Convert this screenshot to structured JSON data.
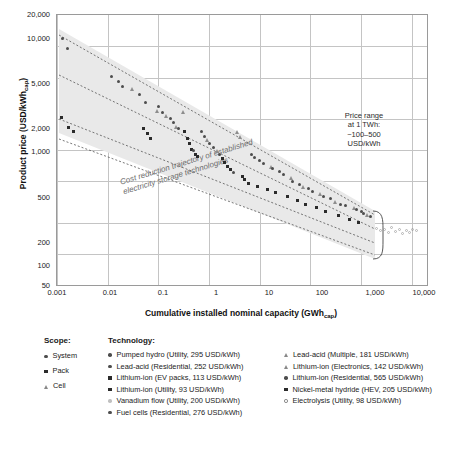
{
  "chart_data": {
    "type": "scatter",
    "title": "",
    "xlabel": "Cumulative installed nominal capacity (GWh_cap)",
    "xlabel_main": "Cumulative installed nominal capacity (GWh",
    "xlabel_sub": "cap",
    "ylabel_main": "Product price (USD/kWh",
    "ylabel_sub": "cap",
    "xscale": "log",
    "yscale": "log",
    "xlim": [
      0.001,
      20000
    ],
    "ylim": [
      50,
      20000
    ],
    "xticks": [
      "0.001",
      "0.01",
      "0.1",
      "1",
      "10",
      "100",
      "1,000",
      "10,000"
    ],
    "yticks": [
      "50",
      "100",
      "200",
      "500",
      "1,000",
      "2,000",
      "5,000",
      "10,000",
      "20,000"
    ],
    "grid": true,
    "legend_position": "below",
    "annotations": [
      {
        "id": "price-range-note",
        "text": "Price range\nat 1 TWh:\n~100–500\nUSD/kWh"
      },
      {
        "id": "trajectory-note",
        "text": "Cost reduction trajectory of established\nelectricity storage technologies"
      }
    ],
    "series": [
      {
        "name": "Pumped hydro (Utility, 295 USD/kWh)",
        "scope": "System",
        "marker": "circle",
        "color": "#4d4d4d"
      },
      {
        "name": "Lead-acid (Residential, 252 USD/kWh)",
        "scope": "System",
        "marker": "circle",
        "color": "#4d4d4d"
      },
      {
        "name": "Lithium-ion (EV packs, 113 USD/kWh)",
        "scope": "Pack",
        "marker": "square",
        "color": "#2b2b2b"
      },
      {
        "name": "Lithium-ion (Utility, 93 USD/kWh)",
        "scope": "Pack",
        "marker": "square",
        "color": "#2b2b2b"
      },
      {
        "name": "Vanadium flow (Utility, 200 USD/kWh)",
        "scope": "System",
        "marker": "circle-light",
        "color": "#b5b5b5"
      },
      {
        "name": "Fuel cells (Residential, 276 USD/kWh)",
        "scope": "System",
        "marker": "circle",
        "color": "#5a5a5a"
      },
      {
        "name": "Lead-acid (Multiple, 181 USD/kWh)",
        "scope": "Cell",
        "marker": "triangle",
        "color": "#8d8d8d"
      },
      {
        "name": "Lithium-ion (Electronics, 142 USD/kWh)",
        "scope": "Cell",
        "marker": "triangle",
        "color": "#8d8d8d"
      },
      {
        "name": "Lithium-ion (Residential, 565 USD/kWh)",
        "scope": "System",
        "marker": "circle",
        "color": "#4d4d4d"
      },
      {
        "name": "Nickel-metal hydride (HEV, 205 USD/kWh)",
        "scope": "Pack",
        "marker": "square",
        "color": "#2b2b2b"
      },
      {
        "name": "Electrolysis (Utility, 98 USD/kWh)",
        "scope": "System",
        "marker": "ring",
        "color": "#777777"
      }
    ],
    "points": [
      {
        "x": 0.0013,
        "y": 12000,
        "m": "system"
      },
      {
        "x": 0.0016,
        "y": 9500,
        "m": "system"
      },
      {
        "x": 0.0012,
        "y": 2050,
        "m": "pack"
      },
      {
        "x": 0.0017,
        "y": 1650,
        "m": "pack"
      },
      {
        "x": 0.0021,
        "y": 1500,
        "m": "pack"
      },
      {
        "x": 0.012,
        "y": 5100,
        "m": "system"
      },
      {
        "x": 0.016,
        "y": 4600,
        "m": "system"
      },
      {
        "x": 0.02,
        "y": 4100,
        "m": "system"
      },
      {
        "x": 0.03,
        "y": 3900,
        "m": "cell"
      },
      {
        "x": 0.042,
        "y": 3400,
        "m": "system"
      },
      {
        "x": 0.055,
        "y": 2900,
        "m": "system"
      },
      {
        "x": 0.05,
        "y": 1600,
        "m": "pack"
      },
      {
        "x": 0.06,
        "y": 1450,
        "m": "pack"
      },
      {
        "x": 0.07,
        "y": 1280,
        "m": "pack"
      },
      {
        "x": 0.09,
        "y": 2400,
        "m": "cell"
      },
      {
        "x": 0.1,
        "y": 2600,
        "m": "system"
      },
      {
        "x": 0.12,
        "y": 2300,
        "m": "system"
      },
      {
        "x": 0.14,
        "y": 2150,
        "m": "cell"
      },
      {
        "x": 0.17,
        "y": 2000,
        "m": "system"
      },
      {
        "x": 0.2,
        "y": 1850,
        "m": "system"
      },
      {
        "x": 0.22,
        "y": 1700,
        "m": "cell"
      },
      {
        "x": 0.25,
        "y": 1600,
        "m": "system"
      },
      {
        "x": 0.3,
        "y": 2350,
        "m": "cell"
      },
      {
        "x": 0.33,
        "y": 1500,
        "m": "pack"
      },
      {
        "x": 0.38,
        "y": 1300,
        "m": "pack"
      },
      {
        "x": 0.42,
        "y": 1150,
        "m": "pack"
      },
      {
        "x": 0.45,
        "y": 1020,
        "m": "pack"
      },
      {
        "x": 0.5,
        "y": 980,
        "m": "system"
      },
      {
        "x": 0.55,
        "y": 900,
        "m": "pack"
      },
      {
        "x": 0.6,
        "y": 870,
        "m": "pack"
      },
      {
        "x": 0.7,
        "y": 1500,
        "m": "system"
      },
      {
        "x": 0.8,
        "y": 1350,
        "m": "system"
      },
      {
        "x": 0.9,
        "y": 1250,
        "m": "cell"
      },
      {
        "x": 1.0,
        "y": 1150,
        "m": "system"
      },
      {
        "x": 1.2,
        "y": 1050,
        "m": "system"
      },
      {
        "x": 1.4,
        "y": 980,
        "m": "cell"
      },
      {
        "x": 1.6,
        "y": 900,
        "m": "system"
      },
      {
        "x": 1.8,
        "y": 820,
        "m": "pack"
      },
      {
        "x": 2.0,
        "y": 760,
        "m": "pack"
      },
      {
        "x": 2.3,
        "y": 700,
        "m": "pack"
      },
      {
        "x": 2.7,
        "y": 650,
        "m": "pack"
      },
      {
        "x": 3.0,
        "y": 610,
        "m": "system"
      },
      {
        "x": 3.5,
        "y": 1500,
        "m": "cell"
      },
      {
        "x": 4.0,
        "y": 1350,
        "m": "cell"
      },
      {
        "x": 4.5,
        "y": 560,
        "m": "pack"
      },
      {
        "x": 5.0,
        "y": 520,
        "m": "pack"
      },
      {
        "x": 6.0,
        "y": 480,
        "m": "pack"
      },
      {
        "x": 7.0,
        "y": 900,
        "m": "system"
      },
      {
        "x": 8.0,
        "y": 840,
        "m": "system"
      },
      {
        "x": 9.0,
        "y": 450,
        "m": "pack"
      },
      {
        "x": 10,
        "y": 800,
        "m": "system"
      },
      {
        "x": 12,
        "y": 740,
        "m": "system"
      },
      {
        "x": 14,
        "y": 420,
        "m": "pack"
      },
      {
        "x": 16,
        "y": 700,
        "m": "cell"
      },
      {
        "x": 18,
        "y": 660,
        "m": "system"
      },
      {
        "x": 20,
        "y": 390,
        "m": "pack"
      },
      {
        "x": 25,
        "y": 620,
        "m": "system"
      },
      {
        "x": 30,
        "y": 580,
        "m": "system"
      },
      {
        "x": 35,
        "y": 360,
        "m": "pack"
      },
      {
        "x": 40,
        "y": 540,
        "m": "cell"
      },
      {
        "x": 45,
        "y": 500,
        "m": "system"
      },
      {
        "x": 55,
        "y": 330,
        "m": "pack"
      },
      {
        "x": 60,
        "y": 470,
        "m": "system"
      },
      {
        "x": 70,
        "y": 450,
        "m": "cell"
      },
      {
        "x": 80,
        "y": 300,
        "m": "pack"
      },
      {
        "x": 90,
        "y": 430,
        "m": "system"
      },
      {
        "x": 110,
        "y": 400,
        "m": "system"
      },
      {
        "x": 130,
        "y": 280,
        "m": "pack"
      },
      {
        "x": 150,
        "y": 380,
        "m": "cell"
      },
      {
        "x": 180,
        "y": 360,
        "m": "system"
      },
      {
        "x": 200,
        "y": 255,
        "m": "pack"
      },
      {
        "x": 250,
        "y": 340,
        "m": "system"
      },
      {
        "x": 300,
        "y": 320,
        "m": "cell"
      },
      {
        "x": 350,
        "y": 235,
        "m": "pack"
      },
      {
        "x": 400,
        "y": 300,
        "m": "system"
      },
      {
        "x": 500,
        "y": 290,
        "m": "system"
      },
      {
        "x": 600,
        "y": 215,
        "m": "pack"
      },
      {
        "x": 700,
        "y": 280,
        "m": "cell"
      },
      {
        "x": 800,
        "y": 265,
        "m": "system"
      },
      {
        "x": 900,
        "y": 200,
        "m": "pack"
      },
      {
        "x": 1000,
        "y": 255,
        "m": "system"
      },
      {
        "x": 1100,
        "y": 245,
        "m": "system"
      },
      {
        "x": 1300,
        "y": 240,
        "m": "cell"
      },
      {
        "x": 1500,
        "y": 230,
        "m": "system"
      },
      {
        "x": 2000,
        "y": 175,
        "m": "ring"
      },
      {
        "x": 2400,
        "y": 168,
        "m": "ring"
      },
      {
        "x": 2900,
        "y": 172,
        "m": "ring"
      },
      {
        "x": 3400,
        "y": 160,
        "m": "ring"
      },
      {
        "x": 4000,
        "y": 178,
        "m": "ring"
      },
      {
        "x": 4800,
        "y": 165,
        "m": "ring"
      },
      {
        "x": 5600,
        "y": 170,
        "m": "ring"
      },
      {
        "x": 6600,
        "y": 158,
        "m": "ring"
      },
      {
        "x": 7800,
        "y": 168,
        "m": "ring"
      },
      {
        "x": 9000,
        "y": 162,
        "m": "ring"
      },
      {
        "x": 10500,
        "y": 172,
        "m": "ring"
      },
      {
        "x": 12500,
        "y": 166,
        "m": "ring"
      }
    ]
  },
  "legend": {
    "scope_header": "Scope:",
    "tech_header": "Technology:",
    "scope_items": [
      {
        "label": "System",
        "marker": "circle"
      },
      {
        "label": "Pack",
        "marker": "square"
      },
      {
        "label": "Cell",
        "marker": "triangle"
      }
    ],
    "tech_items": [
      {
        "label": "Pumped hydro (Utility, 295 USD/kWh)",
        "marker": "circle"
      },
      {
        "label": "Lead-acid (Multiple, 181 USD/kWh)",
        "marker": "triangle"
      },
      {
        "label": "Lead-acid (Residential, 252 USD/kWh)",
        "marker": "circle"
      },
      {
        "label": "Lithium-ion (Electronics, 142 USD/kWh)",
        "marker": "triangle"
      },
      {
        "label": "Lithium-ion (EV packs, 113 USD/kWh)",
        "marker": "square"
      },
      {
        "label": "Lithium-ion (Residential, 565 USD/kWh)",
        "marker": "circle"
      },
      {
        "label": "Lithium-ion (Utility, 93 USD/kWh)",
        "marker": "square"
      },
      {
        "label": "Nickel-metal hydride (HEV, 205 USD/kWh)",
        "marker": "square"
      },
      {
        "label": "Vanadium flow (Utility, 200 USD/kWh)",
        "marker": "circle-light"
      },
      {
        "label": "Electrolysis (Utility, 98 USD/kWh)",
        "marker": "ring"
      },
      {
        "label": "Fuel cells (Residential, 276 USD/kWh)",
        "marker": "circle"
      }
    ]
  }
}
